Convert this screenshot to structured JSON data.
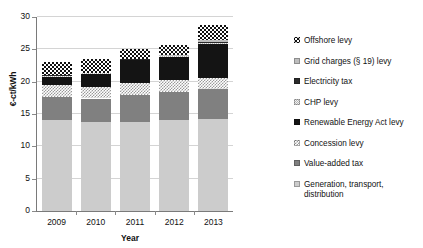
{
  "chart_data": {
    "type": "bar",
    "subtype": "stacked-bar",
    "title": "",
    "xlabel": "Year",
    "ylabel": "€-ct/kWh",
    "categories": [
      "2009",
      "2010",
      "2011",
      "2012",
      "2013"
    ],
    "ylim": [
      0,
      30
    ],
    "ytick_values": [
      0,
      5,
      10,
      15,
      20,
      25,
      30
    ],
    "ytick_labels": [
      "0",
      "5",
      "10",
      "15",
      "20",
      "25",
      "30"
    ],
    "grid": true,
    "legend_position": "right",
    "totals": [
      23.0,
      23.5,
      25.1,
      25.6,
      28.8
    ],
    "series": [
      {
        "name": "Generation, transport, distribution",
        "legend_label": "Generation, transport,\ndistribution",
        "swatch": "light-gray-solid",
        "color": "#cccccc",
        "values": [
          14.0,
          13.8,
          13.7,
          14.0,
          14.2
        ]
      },
      {
        "name": "Value-added tax",
        "legend_label": "Value-added tax",
        "swatch": "mid-gray-solid",
        "color": "#808080",
        "values": [
          3.7,
          3.6,
          4.3,
          4.4,
          4.6
        ]
      },
      {
        "name": "Concession levy",
        "legend_label": "Concession levy",
        "swatch": "light-checker",
        "color": "#9a9a9a",
        "values": [
          1.8,
          1.8,
          1.8,
          1.8,
          1.8
        ]
      },
      {
        "name": "Renewable Energy Act levy",
        "legend_label": "Renewable Energy Act levy",
        "swatch": "black-solid",
        "color": "#141414",
        "values": [
          1.3,
          2.0,
          3.5,
          3.6,
          5.3
        ]
      },
      {
        "name": "CHP levy",
        "legend_label": "CHP levy",
        "swatch": "faint-checker",
        "color": "#b5b5b5",
        "values": [
          0.1,
          0.1,
          0.1,
          0.1,
          0.1
        ]
      },
      {
        "name": "Electricity tax",
        "legend_label": "Electricity tax",
        "swatch": "dark-dash",
        "color": "#2b2b2b",
        "values": [
          0.1,
          0.1,
          0.1,
          0.1,
          0.1
        ]
      },
      {
        "name": "Grid charges (§ 19) levy",
        "legend_label": "Grid charges (§ 19) levy",
        "swatch": "gray-solid-small",
        "color": "#bdbdbd",
        "values": [
          0.0,
          0.0,
          0.0,
          0.2,
          0.3
        ]
      },
      {
        "name": "Offshore levy",
        "legend_label": "Offshore levy",
        "swatch": "black-white-checker",
        "color": "#111111",
        "values": [
          2.0,
          2.1,
          1.6,
          1.5,
          2.4
        ]
      }
    ],
    "legend_order_top_to_bottom": [
      "Offshore levy",
      "Grid charges (§ 19) levy",
      "Electricity tax",
      "CHP levy",
      "Renewable Energy Act levy",
      "Concession levy",
      "Value-added tax",
      "Generation, transport, distribution"
    ]
  }
}
